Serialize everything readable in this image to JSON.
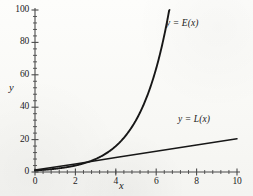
{
  "chart_data": {
    "type": "line",
    "title": "",
    "xlabel": "x",
    "ylabel": "y",
    "xlim": [
      0,
      10
    ],
    "ylim": [
      0,
      100
    ],
    "grid": false,
    "legend_position": "inline-annotations",
    "x_ticks": [
      "0",
      "2",
      "4",
      "6",
      "8",
      "10"
    ],
    "x_tick_values": [
      0,
      2,
      4,
      6,
      8,
      10
    ],
    "y_ticks": [
      "0",
      "20",
      "40",
      "60",
      "80",
      "100"
    ],
    "y_tick_values": [
      0,
      20,
      40,
      60,
      80,
      100
    ],
    "x_minor_tick_step": 0.4,
    "y_minor_tick_step": 4,
    "series": [
      {
        "name": "y = E(x)",
        "kind": "exponential",
        "x": [
          0,
          0.5,
          1,
          1.5,
          2,
          2.5,
          3,
          3.5,
          4,
          4.5,
          5,
          5.5,
          6,
          6.4
        ],
        "values": [
          1,
          1.4,
          2,
          2.8,
          4,
          5.7,
          8,
          11.3,
          16,
          22.6,
          32,
          45.3,
          64,
          84.4
        ]
      },
      {
        "name": "y = L(x)",
        "kind": "linear",
        "x": [
          0,
          2,
          4,
          6,
          8,
          10
        ],
        "values": [
          1.2,
          5,
          8.9,
          12.8,
          16.7,
          20.5
        ]
      }
    ],
    "annotations": [
      {
        "text_prefix": "y = ",
        "text_fn": "E",
        "text_suffix": "(x)",
        "label": "y = E(x)",
        "x": 6.9,
        "y": 93
      },
      {
        "text_prefix": "y = ",
        "text_fn": "L",
        "text_suffix": "(x)",
        "label": "y = L(x)",
        "x": 8.2,
        "y": 28
      }
    ],
    "ink_color": "#1b1b1b",
    "axis_color": "#4a4a4a",
    "background_color": "#fbfbf9"
  },
  "axis_labels": {
    "x": "x",
    "y": "y"
  },
  "curve_labels": {
    "exponential": {
      "prefix": "y = ",
      "fn": "E",
      "suffix": "(x)"
    },
    "linear": {
      "prefix": "y = ",
      "fn": "L",
      "suffix": "(x)"
    }
  }
}
